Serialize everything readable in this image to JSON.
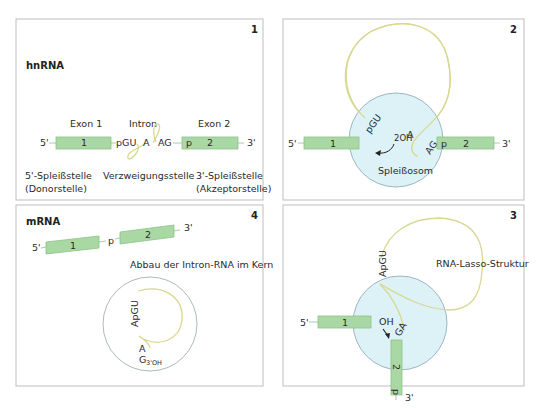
{
  "colors": {
    "exon_fill": "#a9d8a4",
    "intron_strand": "#d8d890",
    "spliceosome_fill": "#dcf2f7",
    "panel_border": "#c8c8c8"
  },
  "panel1": {
    "number": "1",
    "heading": "hnRNA",
    "exon1_label": "Exon 1",
    "intron_label": "Intron",
    "exon2_label": "Exon 2",
    "five_prime": "5'",
    "three_prime": "3'",
    "exon1_number": "1",
    "exon2_number": "2",
    "pgu": "pGU",
    "branch_a": "A",
    "ag": "AG",
    "p": "p",
    "donor_line1": "5'-Spleißstelle",
    "donor_line2": "(Donorstelle)",
    "branch_label": "Verzweigungsstelle",
    "acceptor_line1": "3'-Spleißstelle",
    "acceptor_line2": "(Akzeptorstelle)"
  },
  "panel2": {
    "number": "2",
    "five_prime": "5'",
    "three_prime": "3'",
    "exon1_number": "1",
    "exon2_number": "2",
    "pgu": "pGU",
    "two_oh": "2OH",
    "branch_a": "A",
    "ag": "AG",
    "p": "p",
    "spliceosome_label": "Spleißosom"
  },
  "panel3": {
    "number": "3",
    "five_prime": "5'",
    "three_prime": "3'",
    "exon1_number": "1",
    "exon2_number": "2",
    "apgu": "ApGU",
    "oh": "OH",
    "ga": "GA",
    "p": "p",
    "lasso_label": "RNA-Lasso-Struktur"
  },
  "panel4": {
    "number": "4",
    "heading": "mRNA",
    "five_prime": "5'",
    "three_prime": "3'",
    "exon1_number": "1",
    "exon2_number": "2",
    "p": "p",
    "degradation_label": "Abbau der Intron-RNA im Kern",
    "apgu": "ApGU",
    "a": "A",
    "g": "G",
    "g_subscript": "3'OH"
  }
}
